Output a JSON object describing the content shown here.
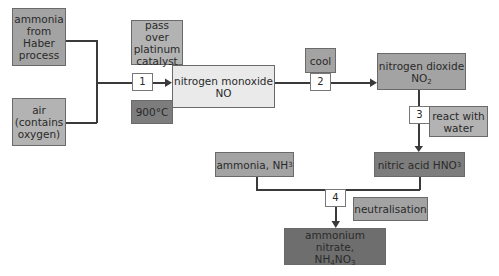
{
  "diagram": {
    "nodes": {
      "ammonia_haber": {
        "lines": [
          "ammonia",
          "from",
          "Haber",
          "process"
        ]
      },
      "air": {
        "lines": [
          "air",
          "(contains",
          "oxygen)"
        ]
      },
      "catalyst": {
        "lines": [
          "pass over",
          "platinum",
          "catalyst"
        ]
      },
      "temperature": {
        "label": "900°C"
      },
      "nitrogen_monoxide": {
        "name": "nitrogen monoxide",
        "formula": "NO"
      },
      "cool": {
        "label": "cool"
      },
      "nitrogen_dioxide": {
        "name": "nitrogen dioxide",
        "formula_main": "NO",
        "formula_sub": "2"
      },
      "react_water": {
        "lines": [
          "react with",
          "water"
        ]
      },
      "nitric_acid": {
        "name": "nitric acid HNO",
        "formula_sub": "3"
      },
      "ammonia_nh3": {
        "name": "ammonia, NH",
        "formula_sub": "3"
      },
      "neutralisation": {
        "label": "neutralisation"
      },
      "ammonium_nitrate": {
        "name": "ammonium nitrate,",
        "f1": "NH",
        "s1": "4",
        "f2": "NO",
        "s2": "3"
      }
    },
    "steps": [
      "1",
      "2",
      "3",
      "4"
    ],
    "colors": {
      "dark": "#7d7d7d",
      "darkest": "#6e6e6e",
      "mid": "#a3a3a3",
      "light": "#b3b3b3",
      "pale": "#eaeaea",
      "line": "#3a3a3a"
    }
  }
}
